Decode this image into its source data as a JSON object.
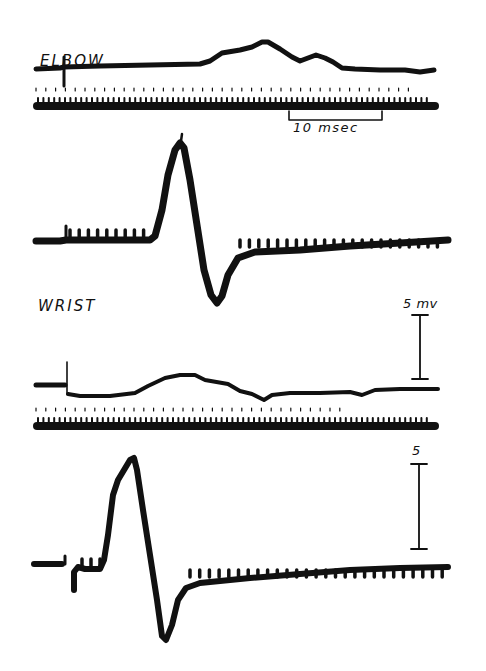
{
  "chart_data": {
    "type": "line",
    "title": "",
    "panels": [
      {
        "id": "elbow-sensory",
        "label": "ELBOW",
        "description": "Nerve action potential recorded on stimulation at elbow (upper trace) with timing trace"
      },
      {
        "id": "elbow-muscle",
        "label": "",
        "description": "Evoked muscle action potential on elbow stimulation"
      },
      {
        "id": "wrist-sensory",
        "label": "WRIST",
        "description": "Nerve action potential recorded on stimulation at wrist (upper trace) with timing trace"
      },
      {
        "id": "wrist-muscle",
        "label": "",
        "description": "Evoked muscle action potential on wrist stimulation"
      }
    ],
    "scale_bars": [
      {
        "axis": "time",
        "value": 10,
        "unit": "msec",
        "label": "10 msec"
      },
      {
        "axis": "voltage",
        "value": 5,
        "unit": "mv",
        "label": "5 mv"
      },
      {
        "axis": "voltage",
        "value": 5,
        "unit": "",
        "label": "5"
      }
    ],
    "xlabel": "",
    "ylabel": "",
    "grid": false,
    "legend": null
  },
  "labels": {
    "elbow": "ELBOW",
    "wrist": "WRIST",
    "time_scale": "10 msec",
    "volt_scale_upper": "5 mv",
    "volt_scale_lower": "5"
  },
  "colors": {
    "trace": "#111111",
    "background": "#ffffff"
  }
}
